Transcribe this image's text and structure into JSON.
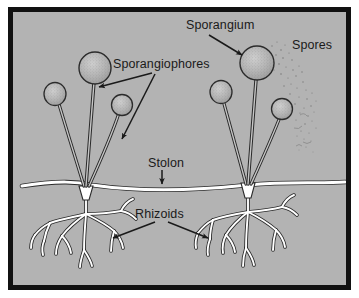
{
  "figure": {
    "type": "labeled-biological-diagram",
    "background_color": "#b3b3b3",
    "frame_color": "#111111",
    "outer_color": "#ffffff",
    "ink_color": "#1a1a1a",
    "structure_fill": "#ffffff",
    "sporangium_fill": "#b0b0b0"
  },
  "labels": {
    "sporangium": "Sporangium",
    "sporangiophores": "Sporangiophores",
    "spores": "Spores",
    "stolon": "Stolon",
    "rhizoids": "Rhizoids"
  },
  "diagram_data": {
    "type": "diagram",
    "parts": [
      {
        "name": "Sporangium",
        "description": "Round spore-bearing sac at tip of each upright stalk; stippled gray texture",
        "count": 6,
        "label_position": "top-center"
      },
      {
        "name": "Sporangiophores",
        "description": "Upright aerial stalks that bear the sporangia, arising in clusters from the stolon nodes",
        "count": 6,
        "label_position": "upper-left"
      },
      {
        "name": "Spores",
        "description": "Fine dusty particles released from a ruptured sporangium, drifting to the right",
        "label_position": "top-right"
      },
      {
        "name": "Stolon",
        "description": "Horizontal white hypha running across the surface, connecting the two clusters",
        "count": 1,
        "label_position": "center"
      },
      {
        "name": "Rhizoids",
        "description": "Branching root-like hyphae anchoring the mycelium below the surface",
        "count": 2,
        "label_position": "center-lower"
      }
    ],
    "clusters": [
      {
        "id": "left-cluster",
        "anchor_x": 86,
        "sporangiophores": 3,
        "sporangia": 3,
        "has_rhizoids": true
      },
      {
        "id": "right-cluster",
        "anchor_x": 248,
        "sporangiophores": 3,
        "sporangia": 3,
        "has_rhizoids": true,
        "releasing_spores": true
      }
    ],
    "annotation_arrows": [
      {
        "from_label": "Sporangium",
        "to_part": "right-cluster-large-sporangium"
      },
      {
        "from_label": "Sporangiophores",
        "to_part": "left-cluster-stalk-1"
      },
      {
        "from_label": "Sporangiophores",
        "to_part": "left-cluster-stalk-3"
      },
      {
        "from_label": "Stolon",
        "to_part": "stolon-midpoint"
      },
      {
        "from_label": "Rhizoids",
        "to_part": "left-rhizoid-branch"
      },
      {
        "from_label": "Rhizoids",
        "to_part": "right-rhizoid-branch"
      }
    ]
  }
}
